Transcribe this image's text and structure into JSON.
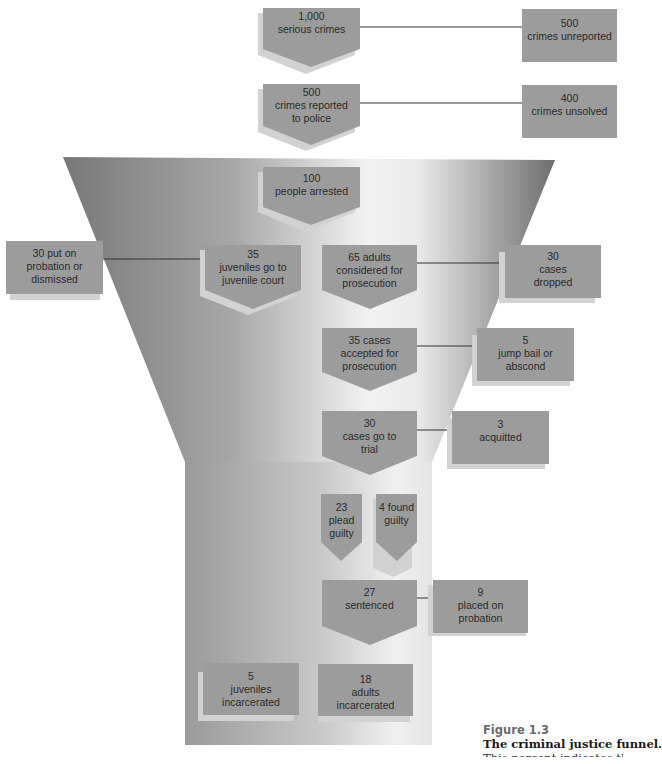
{
  "colors": {
    "box_fill": "#9c9c9c",
    "box_shadow": "#d6d6d6",
    "funnel_dark": "#7a7a7a",
    "funnel_light": "#f4f4f4",
    "connector": "#333333",
    "figure_label": "#6a6a6a"
  },
  "funnel_nodes": [
    {
      "id": "serious-crimes",
      "num": "1,000",
      "label": "serious crimes"
    },
    {
      "id": "crimes-reported",
      "num": "500",
      "label": "crimes reported to police"
    },
    {
      "id": "people-arrested",
      "num": "100",
      "label": "people arrested"
    },
    {
      "id": "juveniles-court",
      "num": "35",
      "label": "juveniles go to juvenile court"
    },
    {
      "id": "adults-considered",
      "num": "65 adults",
      "label": "considered for prosecution"
    },
    {
      "id": "cases-accepted",
      "num": "35 cases",
      "label": "accepted for prosecution"
    },
    {
      "id": "cases-trial",
      "num": "30",
      "label": "cases go to trial"
    },
    {
      "id": "plead-guilty",
      "num": "23",
      "label": "plead guilty"
    },
    {
      "id": "found-guilty",
      "num": "4 found",
      "label": "guilty"
    },
    {
      "id": "sentenced",
      "num": "27",
      "label": "sentenced"
    },
    {
      "id": "juveniles-incarcerated",
      "num": "5",
      "label": "juveniles incarcerated"
    },
    {
      "id": "adults-incarcerated",
      "num": "18",
      "label": "adults incarcerated"
    }
  ],
  "side_nodes": [
    {
      "id": "crimes-unreported",
      "num": "500",
      "label": "crimes unreported"
    },
    {
      "id": "crimes-unsolved",
      "num": "400",
      "label": "crimes unsolved"
    },
    {
      "id": "probation-dismissed",
      "num": "30 put on",
      "label": "probation or dismissed"
    },
    {
      "id": "cases-dropped",
      "num": "30",
      "label": "cases dropped"
    },
    {
      "id": "jump-bail",
      "num": "5",
      "label": "jump bail or abscond"
    },
    {
      "id": "acquitted",
      "num": "3",
      "label": "acquitted"
    },
    {
      "id": "placed-probation",
      "num": "9",
      "label": "placed on probation"
    }
  ],
  "caption": {
    "figure": "Figure 1.3",
    "title": "The criminal justice funnel.",
    "body_cut": "This percent indicates that"
  }
}
